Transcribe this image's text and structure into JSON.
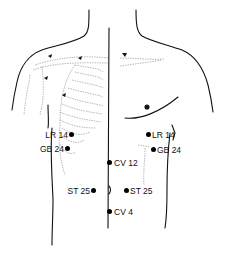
{
  "diagram": {
    "title": "",
    "points": [
      {
        "id": "lr14-left",
        "label": "LR 14",
        "side": "left",
        "dot": [
          71,
          134
        ],
        "label_pos": "left"
      },
      {
        "id": "gb24-left",
        "label": "GB 24",
        "side": "left",
        "dot": [
          67,
          148
        ],
        "label_pos": "left"
      },
      {
        "id": "lr14-right",
        "label": "LR 14",
        "side": "right",
        "dot": [
          148,
          134
        ],
        "label_pos": "right"
      },
      {
        "id": "gb24-right",
        "label": "GB 24",
        "side": "right",
        "dot": [
          153,
          149
        ],
        "label_pos": "right"
      },
      {
        "id": "cv12",
        "label": "CV 12",
        "side": "midline",
        "dot": [
          110,
          162
        ],
        "label_pos": "right"
      },
      {
        "id": "st25-left",
        "label": "ST 25",
        "side": "left",
        "dot": [
          93,
          190
        ],
        "label_pos": "left"
      },
      {
        "id": "st25-right",
        "label": "ST 25",
        "side": "right",
        "dot": [
          126,
          190
        ],
        "label_pos": "right"
      },
      {
        "id": "cv4",
        "label": "CV 4",
        "side": "midline",
        "dot": [
          109,
          211
        ],
        "label_pos": "right"
      }
    ],
    "line_color": "#111111",
    "faint_color": "#9a9a9a"
  }
}
